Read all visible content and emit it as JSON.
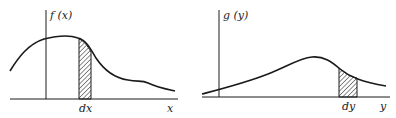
{
  "panels": [
    {
      "id": "left",
      "y_label": "f (x)",
      "shaded_label": "dx",
      "x_label": "x"
    },
    {
      "id": "right",
      "y_label": "g (y)",
      "shaded_label": "dy",
      "x_label": "y"
    }
  ],
  "colors": {
    "line": "#1a1a1a",
    "background": "#ffffff"
  }
}
